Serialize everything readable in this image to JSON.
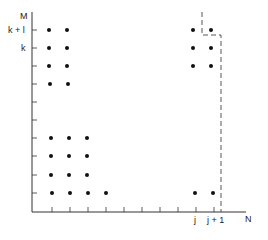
{
  "diagram": {
    "axes": {
      "y_label": "M",
      "x_label": "N",
      "y_tick_labels": [
        {
          "text": "k + l",
          "y": 30
        },
        {
          "text": "k",
          "y": 48
        }
      ],
      "x_tick_labels": [
        {
          "text": "j",
          "x": 195
        },
        {
          "text": "j + 1",
          "x": 214
        }
      ]
    },
    "origin": {
      "x": 32,
      "y": 212
    },
    "x_ticks": [
      52,
      70,
      88,
      106,
      124,
      142,
      160,
      178,
      196,
      214
    ],
    "y_ticks": [
      30,
      48,
      66,
      84,
      102,
      120,
      138,
      156,
      175,
      193
    ],
    "dots": [
      [
        49,
        30
      ],
      [
        67,
        30
      ],
      [
        49,
        48
      ],
      [
        67,
        48
      ],
      [
        49,
        66
      ],
      [
        67,
        66
      ],
      [
        50,
        84
      ],
      [
        68,
        84
      ],
      [
        51,
        138
      ],
      [
        69,
        138
      ],
      [
        87,
        138
      ],
      [
        51,
        156
      ],
      [
        69,
        156
      ],
      [
        87,
        156
      ],
      [
        51,
        175
      ],
      [
        69,
        175
      ],
      [
        87,
        175
      ],
      [
        52,
        193
      ],
      [
        70,
        193
      ],
      [
        88,
        193
      ],
      [
        106,
        193
      ],
      [
        193,
        30
      ],
      [
        211,
        30
      ],
      [
        193,
        48
      ],
      [
        211,
        48
      ],
      [
        193,
        66
      ],
      [
        211,
        66
      ],
      [
        195,
        193
      ],
      [
        213,
        193
      ]
    ],
    "dashed_boundary": "M202,12 L202,35 L221,35 L221,212"
  }
}
